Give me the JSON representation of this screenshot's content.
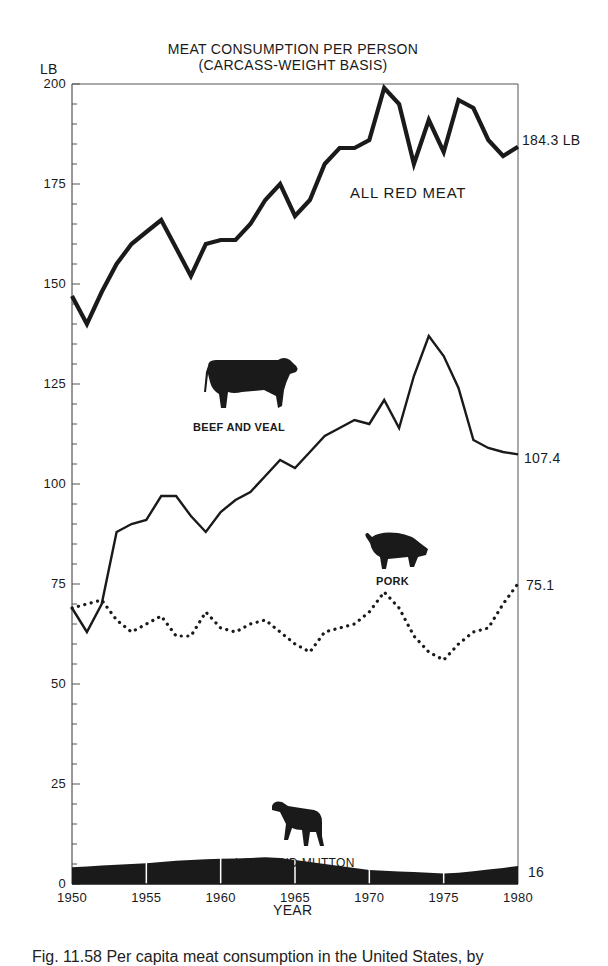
{
  "figure": {
    "title_line1": "MEAT CONSUMPTION PER PERSON",
    "title_line2": "(CARCASS-WEIGHT BASIS)",
    "y_unit": "LB",
    "x_label": "YEAR",
    "caption": "Fig. 11.58    Per capita meat consumption in the United States, by"
  },
  "labels": {
    "all_red_meat": "ALL RED MEAT",
    "beef_and_veal": "BEEF AND VEAL",
    "pork": "PORK",
    "lamb_and_mutton": "LAMB AND MUTTON",
    "end_all_red_meat": "184.3 LB",
    "end_beef": "107.4",
    "end_pork": "75.1",
    "end_lamb": "16"
  },
  "icons": {
    "beef": "cow-icon",
    "pork": "pig-icon",
    "lamb": "lamb-icon"
  },
  "colors": {
    "ink": "#1a1a1a",
    "axis": "#555555",
    "background": "#ffffff"
  },
  "chart_data": {
    "type": "line",
    "xlabel": "YEAR",
    "ylabel": "LB",
    "ylim": [
      0,
      200
    ],
    "xlim": [
      1950,
      1980
    ],
    "y_ticks": [
      0,
      25,
      50,
      75,
      100,
      125,
      150,
      175,
      200
    ],
    "x_ticks": [
      1950,
      1955,
      1960,
      1965,
      1970,
      1975,
      1980
    ],
    "grid": false,
    "legend": "inline labels with animal icons",
    "x": [
      1950,
      1951,
      1952,
      1953,
      1954,
      1955,
      1956,
      1957,
      1958,
      1959,
      1960,
      1961,
      1962,
      1963,
      1964,
      1965,
      1966,
      1967,
      1968,
      1969,
      1970,
      1971,
      1972,
      1973,
      1974,
      1975,
      1976,
      1977,
      1978,
      1979,
      1980
    ],
    "series": [
      {
        "name": "ALL RED MEAT",
        "style": "thick-solid",
        "end_label": "184.3 LB",
        "values": [
          147,
          140,
          148,
          155,
          160,
          163,
          166,
          159,
          152,
          160,
          161,
          161,
          165,
          171,
          175,
          167,
          171,
          180,
          184,
          184,
          186,
          199,
          195,
          180,
          191,
          183,
          196,
          194,
          186,
          182,
          184.3
        ]
      },
      {
        "name": "BEEF AND VEAL",
        "style": "solid",
        "end_label": "107.4",
        "values": [
          69,
          63,
          70,
          88,
          90,
          91,
          97,
          97,
          92,
          88,
          93,
          96,
          98,
          102,
          106,
          104,
          108,
          112,
          114,
          116,
          115,
          121,
          114,
          127,
          137,
          132,
          124,
          111,
          109,
          108,
          107.4
        ]
      },
      {
        "name": "PORK",
        "style": "dotted",
        "end_label": "75.1",
        "values": [
          69,
          70,
          71,
          66,
          63,
          65,
          67,
          62,
          62,
          68,
          64,
          63,
          65,
          66,
          63,
          60,
          58,
          63,
          64,
          65,
          68,
          73,
          69,
          62,
          58,
          56,
          60,
          63,
          64,
          70,
          75.1
        ]
      },
      {
        "name": "LAMB AND MUTTON",
        "style": "filled-area",
        "end_label": "16",
        "values": [
          4.2,
          4.4,
          4.6,
          4.8,
          5.0,
          5.2,
          5.5,
          5.8,
          6.0,
          6.2,
          6.3,
          6.4,
          6.5,
          6.7,
          6.5,
          6.0,
          5.5,
          5.0,
          4.5,
          4.0,
          3.5,
          3.3,
          3.1,
          3.0,
          2.8,
          2.6,
          2.8,
          3.2,
          3.6,
          4.0,
          4.5
        ]
      }
    ]
  }
}
